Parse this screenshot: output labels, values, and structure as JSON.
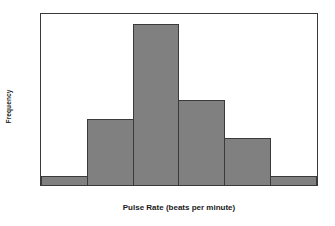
{
  "chart_data": {
    "type": "bar",
    "title": "",
    "xlabel": "Pulse Rate (beats per minute)",
    "ylabel": "Frequency",
    "categories": [
      "39.5-49.5",
      "49.5-59.5",
      "59.5-69.5",
      "69.5-79.5",
      "79.5-89.5",
      "89.5-99.5"
    ],
    "values": [
      1,
      7,
      17,
      9,
      5,
      1
    ],
    "bin_edges": [
      39.5,
      49.5,
      59.5,
      69.5,
      79.5,
      89.5,
      99.5
    ],
    "xticks": [
      "39.5",
      "49.5",
      "59.5",
      "69.5",
      "79.5",
      "89.5",
      "99.5"
    ],
    "yticks": [
      "0",
      "2",
      "4",
      "6",
      "8",
      "10",
      "12",
      "14",
      "16",
      "18"
    ],
    "xlim": [
      39.5,
      99.5
    ],
    "ylim": [
      0,
      18
    ],
    "grid": false,
    "legend": false,
    "bar_color": "#808080",
    "bar_edge_color": "#3a3a3a",
    "background": "#ffffff"
  }
}
